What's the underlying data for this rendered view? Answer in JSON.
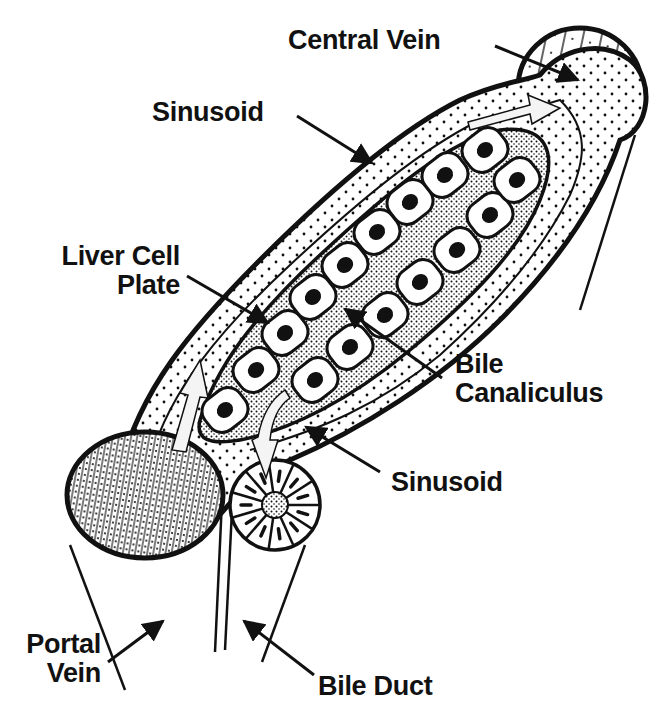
{
  "diagram": {
    "colors": {
      "ink": "#111111",
      "paper": "#ffffff",
      "canal": "#f4f4f4"
    },
    "labels": [
      {
        "id": "central-vein",
        "lines": [
          "Central Vein"
        ],
        "x": 288,
        "y": 26,
        "align": "left"
      },
      {
        "id": "sinusoid-top",
        "lines": [
          "Sinusoid"
        ],
        "x": 152,
        "y": 98,
        "align": "left"
      },
      {
        "id": "liver-cell-plate",
        "lines": [
          "Liver Cell",
          "Plate"
        ],
        "x": 30,
        "y": 242,
        "align": "right",
        "width": 150
      },
      {
        "id": "bile-canaliculus",
        "lines": [
          "Bile",
          "Canaliculus"
        ],
        "x": 455,
        "y": 350,
        "align": "left"
      },
      {
        "id": "sinusoid-bottom",
        "lines": [
          "Sinusoid"
        ],
        "x": 391,
        "y": 468,
        "align": "left"
      },
      {
        "id": "portal-vein",
        "lines": [
          "Portal",
          "Vein"
        ],
        "x": 5,
        "y": 630,
        "align": "right",
        "width": 96
      },
      {
        "id": "bile-duct",
        "lines": [
          "Bile Duct"
        ],
        "x": 318,
        "y": 672,
        "align": "left"
      }
    ],
    "arrows": [
      {
        "id": "arrow-central-vein",
        "x1": 495,
        "y1": 46,
        "x2": 578,
        "y2": 80
      },
      {
        "id": "arrow-sinusoid-top",
        "x1": 297,
        "y1": 116,
        "x2": 372,
        "y2": 163
      },
      {
        "id": "arrow-liver-cell-plate",
        "x1": 187,
        "y1": 276,
        "x2": 268,
        "y2": 323
      },
      {
        "id": "arrow-bile-canaliculus",
        "x1": 442,
        "y1": 378,
        "x2": 345,
        "y2": 309
      },
      {
        "id": "arrow-sinusoid-bottom",
        "x1": 380,
        "y1": 472,
        "x2": 306,
        "y2": 427
      },
      {
        "id": "arrow-portal-vein",
        "x1": 108,
        "y1": 662,
        "x2": 163,
        "y2": 621
      },
      {
        "id": "arrow-bile-duct",
        "x1": 314,
        "y1": 675,
        "x2": 244,
        "y2": 621
      }
    ],
    "structures": {
      "central_vein": {
        "cx": 580,
        "cy": 88,
        "rx": 62,
        "ry": 60
      },
      "portal_vein": {
        "cx": 145,
        "cy": 495,
        "rx": 78,
        "ry": 63
      },
      "bile_duct": {
        "cx": 275,
        "cy": 505,
        "r": 45,
        "segments": 11
      },
      "lobule_outline": "M120,470 C140,390 190,330 260,260 C330,190 400,130 460,100 C500,82 520,82 540,75 C560,50 600,38 630,60 C655,80 650,130 620,140 C600,200 560,260 500,320 C440,380 360,430 290,460 C250,478 230,500 200,540",
      "sinusoid_inner": "M150,460 C170,390 220,330 290,265 C360,200 420,150 480,120 C520,110 545,105 560,100 C590,130 585,160 570,195 C540,255 490,310 440,355 C380,405 320,430 250,450",
      "plate_outline": "M200,420 C215,370 250,320 320,255 C390,190 450,140 500,130 C545,125 560,150 540,200 C520,250 470,300 410,350 C350,400 290,430 240,440 C210,445 195,440 200,420 Z",
      "cells_upper": [
        [
          225,
          410
        ],
        [
          256,
          370
        ],
        [
          285,
          333
        ],
        [
          313,
          297
        ],
        [
          345,
          265
        ],
        [
          377,
          232
        ],
        [
          410,
          202
        ],
        [
          445,
          175
        ],
        [
          485,
          150
        ]
      ],
      "cells_lower": [
        [
          315,
          380
        ],
        [
          350,
          347
        ],
        [
          385,
          315
        ],
        [
          420,
          282
        ],
        [
          457,
          250
        ],
        [
          490,
          215
        ],
        [
          517,
          180
        ]
      ],
      "flow_arrows": [
        {
          "id": "flow-into-central-vein",
          "d": "M468,122 L530,105 L528,95 L560,108 L532,124 L530,114 L470,130 Z"
        },
        {
          "id": "flow-from-portal-vein",
          "d": "M172,450 L188,395 L180,393 L200,360 L208,398 L200,397 L186,452 Z"
        },
        {
          "id": "flow-to-bile-duct",
          "d": "M258,437 C262,415 270,400 285,390 L290,398 C278,406 272,420 270,440 L278,440 L266,478 L252,440 Z"
        }
      ],
      "tissue_lines": [
        {
          "id": "tissue-left-outer",
          "x1": 70,
          "y1": 545,
          "x2": 125,
          "y2": 690
        },
        {
          "id": "tissue-center-a",
          "x1": 222,
          "y1": 500,
          "x2": 215,
          "y2": 652
        },
        {
          "id": "tissue-center-b",
          "x1": 232,
          "y1": 510,
          "x2": 225,
          "y2": 650
        },
        {
          "id": "tissue-right-duct",
          "x1": 305,
          "y1": 545,
          "x2": 262,
          "y2": 662
        },
        {
          "id": "tissue-right-cv-a",
          "x1": 635,
          "y1": 135,
          "x2": 580,
          "y2": 310
        },
        {
          "id": "tissue-right-cv-b",
          "x1": 512,
          "y1": 285,
          "x2": 502,
          "y2": 310
        }
      ]
    }
  }
}
